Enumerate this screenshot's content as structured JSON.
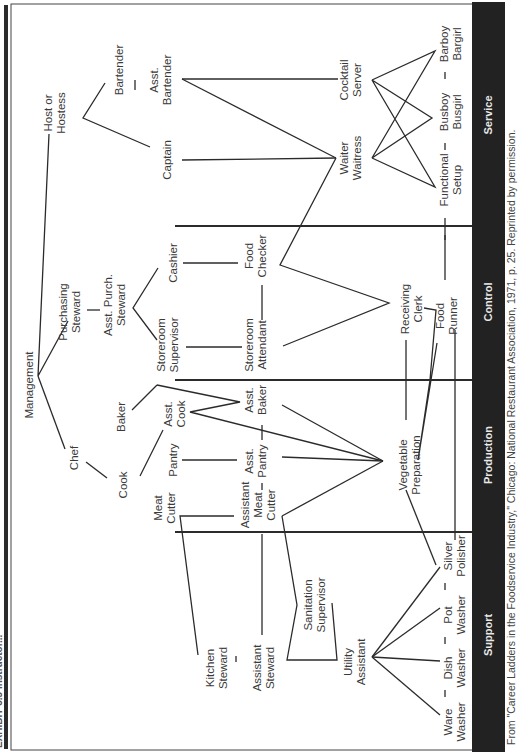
{
  "header": {
    "title": "EXHIBIT 3.5  Instructor..."
  },
  "categories": [
    {
      "id": "service",
      "label": "Service"
    },
    {
      "id": "control",
      "label": "Control"
    },
    {
      "id": "production",
      "label": "Production"
    },
    {
      "id": "support",
      "label": "Support"
    }
  ],
  "caption": "From \"Career Ladders in the Foodservice Industry,\" Chicago: National Restaurant Association, 1971, p. 25. Reprinted by permission.",
  "nodes": {
    "host": [
      "Host or",
      "Hostess"
    ],
    "bartender": [
      "Bartender"
    ],
    "asst_bartender": [
      "Asst.",
      "Bartender"
    ],
    "captain": [
      "Captain"
    ],
    "cocktail_server": [
      "Cocktail",
      "Server"
    ],
    "waiter": [
      "Waiter",
      "Waitress"
    ],
    "barboy": [
      "Barboy",
      "Bargirl"
    ],
    "busboy": [
      "Busboy",
      "Busgirl"
    ],
    "functional_setup": [
      "Functional",
      "Setup"
    ],
    "management": [
      "Management"
    ],
    "purchasing_steward": [
      "Purchasing",
      "Steward"
    ],
    "asst_purch_steward": [
      "Asst. Purch.",
      "Steward"
    ],
    "cashier": [
      "Cashier"
    ],
    "storeroom_supervisor": [
      "Storeroom",
      "Supervisor"
    ],
    "food_checker": [
      "Food",
      "Checker"
    ],
    "storeroom_attendant": [
      "Storeroom",
      "Attendant"
    ],
    "receiving_clerk": [
      "Receiving",
      "Clerk"
    ],
    "food_runner": [
      "Food",
      "Runner"
    ],
    "chef": [
      "Chef"
    ],
    "baker": [
      "Baker"
    ],
    "cook": [
      "Cook"
    ],
    "asst_cook": [
      "Asst.",
      "Cook"
    ],
    "pantry": [
      "Pantry"
    ],
    "asst_baker": [
      "Asst.",
      "Baker"
    ],
    "asst_pantry": [
      "Asst.",
      "Pantry"
    ],
    "vegetable_prep": [
      "Vegetable",
      "Preparation"
    ],
    "meat_cutter": [
      "Meat",
      "Cutter"
    ],
    "asst_meat_cutter": [
      "Assistant",
      "Meat",
      "Cutter"
    ],
    "kitchen_steward": [
      "Kitchen",
      "Steward"
    ],
    "assistant_steward": [
      "Assistant",
      "Steward"
    ],
    "sanitation_supervisor": [
      "Sanitation",
      "Supervisor"
    ],
    "utility_assistant": [
      "Utility",
      "Assistant"
    ],
    "silver_polisher": [
      "Silver",
      "Polisher"
    ],
    "pot_washer": [
      "Pot",
      "Washer"
    ],
    "dish_washer": [
      "Dish",
      "Washer"
    ],
    "ware_washer": [
      "Ware",
      "Washer"
    ]
  }
}
